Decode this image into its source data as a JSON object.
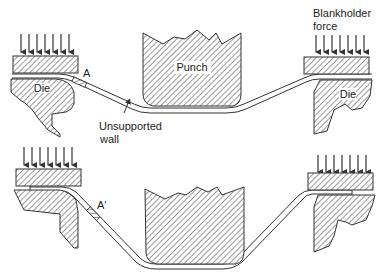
{
  "diagram": {
    "colors": {
      "line": "#333333",
      "hatch": "#555555",
      "background": "#ffffff",
      "text": "#222222"
    },
    "labels": {
      "die_left": "Die",
      "die_right": "Die",
      "punch": "Punch",
      "point_a": "A",
      "point_a_prime": "A′",
      "unsupported_wall_line1": "Unsupported",
      "unsupported_wall_line2": "wall",
      "blankholder_line1": "Blankholder",
      "blankholder_line2": "force"
    },
    "stages": [
      {
        "name": "stage-1",
        "description": "Early draw — punch partially descended, element A near die radius"
      },
      {
        "name": "stage-2",
        "description": "Later draw — punch deeper, element A′ moved into the wall"
      }
    ]
  }
}
